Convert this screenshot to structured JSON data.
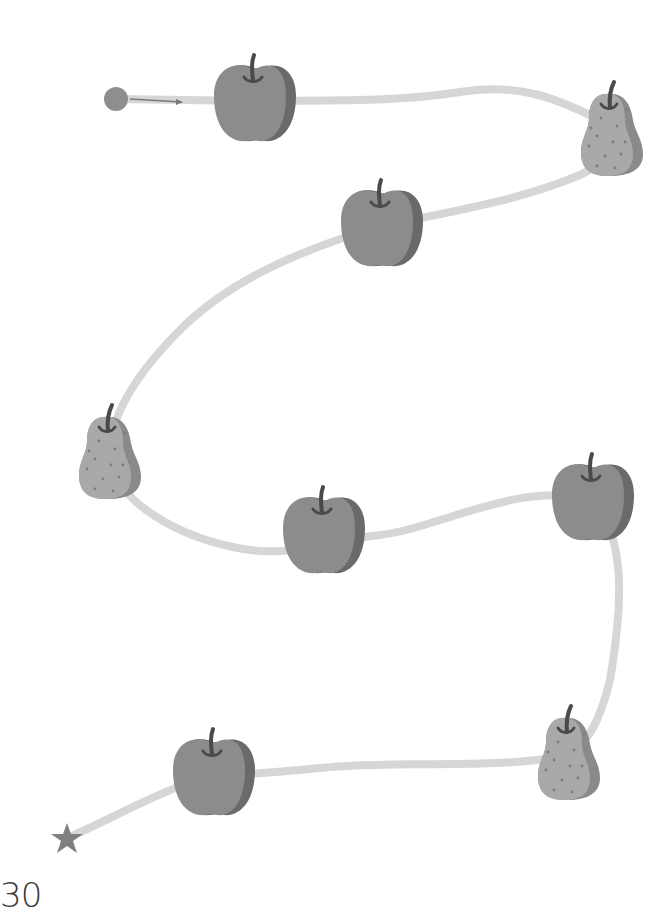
{
  "page": {
    "number": "30",
    "background": "#ffffff"
  },
  "colors": {
    "path": "#d6d6d6",
    "apple_body": "#8c8c8c",
    "apple_side": "#6a6a6a",
    "pear_body": "#a9a9a9",
    "pear_side": "#8a8a8a",
    "stem": "#505050",
    "start_dot": "#8e8e8e",
    "star": "#808080",
    "arrow": "#7a7a7a"
  },
  "maze": {
    "start": {
      "icon": "start-dot-icon",
      "x": 116,
      "y": 99
    },
    "end": {
      "icon": "star-icon",
      "x": 67,
      "y": 838
    },
    "fruits": [
      {
        "type": "apple",
        "x": 254,
        "y": 101
      },
      {
        "type": "pear",
        "x": 611,
        "y": 132
      },
      {
        "type": "apple",
        "x": 381,
        "y": 226
      },
      {
        "type": "pear",
        "x": 109,
        "y": 455
      },
      {
        "type": "apple",
        "x": 323,
        "y": 533
      },
      {
        "type": "apple",
        "x": 592,
        "y": 500
      },
      {
        "type": "pear",
        "x": 568,
        "y": 756
      },
      {
        "type": "apple",
        "x": 213,
        "y": 775
      }
    ]
  }
}
